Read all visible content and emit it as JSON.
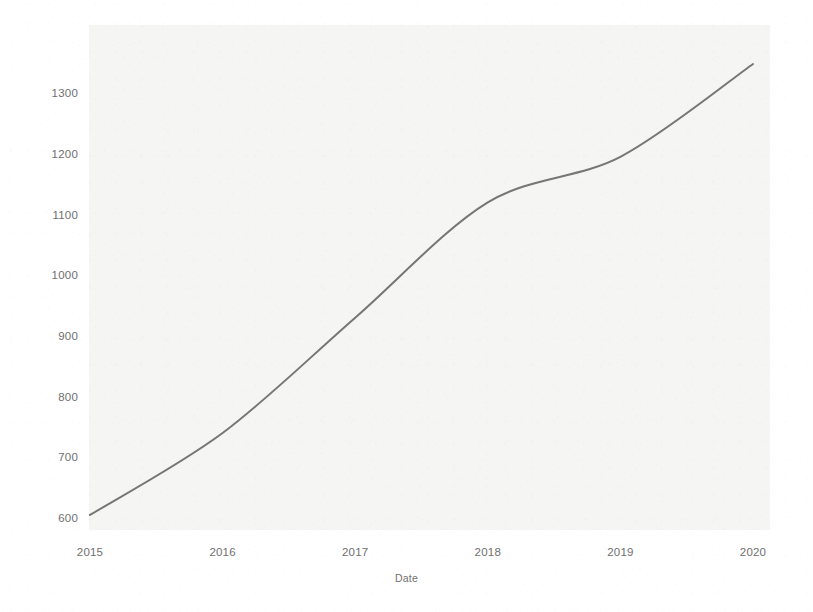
{
  "chart_data": {
    "type": "line",
    "title": "",
    "subtitle": "",
    "xlabel": "Date",
    "ylabel": "",
    "x": [
      2015,
      2016,
      2017,
      2018,
      2019,
      2020
    ],
    "x_tick_labels": [
      "2015",
      "2016",
      "2017",
      "2018",
      "2019",
      "2020"
    ],
    "y_tick_labels": [
      "1300",
      "1200",
      "1100",
      "1000",
      "900",
      "800",
      "700",
      "600"
    ],
    "y_ticks": [
      1300,
      1200,
      1100,
      1000,
      900,
      800,
      700,
      600
    ],
    "series": [
      {
        "name": "",
        "values": [
          605,
          740,
          930,
          1120,
          1195,
          1348
        ],
        "color": "#6a6a6a"
      }
    ],
    "xlim": [
      2015,
      2020
    ],
    "ylim": [
      585,
      1360
    ],
    "grid": false,
    "legend": null,
    "legend_position": "none",
    "annotations": []
  },
  "axes": {
    "y_tick_labels": [
      "1300",
      "1200",
      "1100",
      "1000",
      "900",
      "800",
      "700",
      "600"
    ],
    "x_tick_labels": [
      "2015",
      "2016",
      "2017",
      "2018",
      "2019",
      "2020"
    ],
    "x_axis_title": "Date"
  },
  "style": {
    "line_color": "#6a6a6a",
    "plot_background": "#f5f5f3",
    "figure_background": "#ffffff",
    "tick_label_color": "#6f6f6f"
  }
}
